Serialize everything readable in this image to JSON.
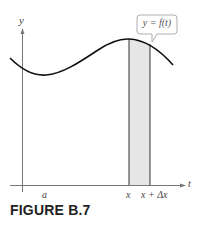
{
  "figure": {
    "caption": "FIGURE B.7",
    "callout_label": "y = f(t)",
    "axes": {
      "y_label": "y",
      "x_label": "t"
    },
    "tick_labels": {
      "a": "a",
      "x": "x",
      "x_plus_dx": "x + Δx"
    },
    "colors": {
      "curve": "#111111",
      "axis": "#777777",
      "strip_fill": "#e6e6e6",
      "strip_border": "#333333",
      "callout_border": "#999999"
    }
  }
}
